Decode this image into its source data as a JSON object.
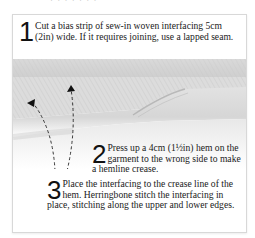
{
  "page": {
    "top_cut_text": "· · · · · · ·"
  },
  "illustration": {
    "description": "hem-with-interfacing-illustration",
    "fabric_color": "#e6e6e6",
    "shadow_color": "#bdbdbd",
    "arrow_color": "#222222"
  },
  "steps": [
    {
      "number": "1",
      "text": "Cut a bias strip of sew-in woven interfacing 5cm (2in) wide. If it requires joining, use a lapped seam."
    },
    {
      "number": "2",
      "text": "Press up a 4cm (1½in) hem on the garment to the wrong side to make a hemline crease."
    },
    {
      "number": "3",
      "text": "Place the interfacing to the crease line of the hem. Herringbone stitch the interfacing in place, stitching along the upper and lower edges."
    }
  ]
}
